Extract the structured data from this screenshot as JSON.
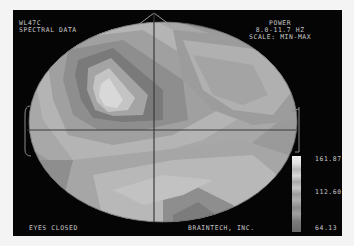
{
  "header": {
    "left_line1": "WL47C",
    "left_line2": "SPECTRAL DATA",
    "right_line1": "POWER",
    "right_line2": "8.0-11.7 HZ",
    "right_line3": "SCALE: MIN-MAX"
  },
  "footer": {
    "condition": "EYES CLOSED",
    "company": "BRAINTECH, INC."
  },
  "scale": {
    "max": "161.87",
    "mid": "112.60",
    "min": "64.13"
  },
  "colors": {
    "background": "#050505",
    "text": "#c8c8c8",
    "crosshair": "#3a3a3a",
    "outline": "#9a9a9a"
  }
}
